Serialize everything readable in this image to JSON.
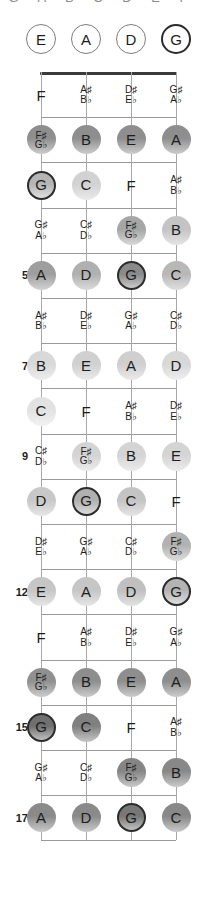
{
  "title_clipped": "G A B C D E F",
  "layout": {
    "strings": [
      "E",
      "A",
      "D",
      "G"
    ],
    "string_x": [
      41,
      86,
      131,
      176
    ],
    "nut_y": 72,
    "fret_spacing": 45.2,
    "open_circle_y": 39,
    "accent_color": "#2c2c2c",
    "nut_color": "#3a3a3a",
    "fret_color": "#9a9a9a",
    "string_color": "#a8a8a8"
  },
  "open_strings": [
    {
      "label": "E",
      "accent": false
    },
    {
      "label": "A",
      "accent": false
    },
    {
      "label": "D",
      "accent": false
    },
    {
      "label": "G",
      "accent": true
    }
  ],
  "fret_numbers": [
    {
      "fret": 5,
      "label": "5"
    },
    {
      "fret": 7,
      "label": "7"
    },
    {
      "fret": 9,
      "label": "9"
    },
    {
      "fret": 12,
      "label": "12"
    },
    {
      "fret": 15,
      "label": "15"
    },
    {
      "fret": 17,
      "label": "17"
    }
  ],
  "frets": [
    {
      "fret": 1,
      "notes": [
        {
          "string": 0,
          "name": "F",
          "shape": "plain",
          "accidental": false,
          "shade": null,
          "accent": false
        },
        {
          "string": 1,
          "name": "A♯/B♭",
          "top": "A♯",
          "bottom": "B♭",
          "shape": "plain",
          "accidental": true,
          "shade": null,
          "accent": false
        },
        {
          "string": 2,
          "name": "D♯/E♭",
          "top": "D♯",
          "bottom": "E♭",
          "shape": "plain",
          "accidental": true,
          "shade": null,
          "accent": false
        },
        {
          "string": 3,
          "name": "G♯/A♭",
          "top": "G♯",
          "bottom": "A♭",
          "shape": "plain",
          "accidental": true,
          "shade": null,
          "accent": false
        }
      ]
    },
    {
      "fret": 2,
      "notes": [
        {
          "string": 0,
          "name": "F♯/G♭",
          "top": "F♯",
          "bottom": "G♭",
          "shape": "circle",
          "accidental": true,
          "shade": "#8e8e8e",
          "accent": false
        },
        {
          "string": 1,
          "name": "B",
          "shape": "circle",
          "accidental": false,
          "shade": "#8e8e8e",
          "accent": false
        },
        {
          "string": 2,
          "name": "E",
          "shape": "circle",
          "accidental": false,
          "shade": "#8e8e8e",
          "accent": false
        },
        {
          "string": 3,
          "name": "A",
          "shape": "circle",
          "accidental": false,
          "shade": "#8e8e8e",
          "accent": false
        }
      ]
    },
    {
      "fret": 3,
      "notes": [
        {
          "string": 0,
          "name": "G",
          "shape": "circle",
          "accidental": false,
          "shade": "#b5b5b5",
          "accent": true
        },
        {
          "string": 1,
          "name": "C",
          "shape": "circle",
          "accidental": false,
          "shade": "#d2d2d2",
          "accent": false
        },
        {
          "string": 2,
          "name": "F",
          "shape": "plain",
          "accidental": false,
          "shade": null,
          "accent": false
        },
        {
          "string": 3,
          "name": "A♯/B♭",
          "top": "A♯",
          "bottom": "B♭",
          "shape": "plain",
          "accidental": true,
          "shade": null,
          "accent": false
        }
      ]
    },
    {
      "fret": 4,
      "notes": [
        {
          "string": 0,
          "name": "G♯/A♭",
          "top": "G♯",
          "bottom": "A♭",
          "shape": "plain",
          "accidental": true,
          "shade": null,
          "accent": false
        },
        {
          "string": 1,
          "name": "C♯/D♭",
          "top": "C♯",
          "bottom": "D♭",
          "shape": "plain",
          "accidental": true,
          "shade": null,
          "accent": false
        },
        {
          "string": 2,
          "name": "F♯/G♭",
          "top": "F♯",
          "bottom": "G♭",
          "shape": "circle",
          "accidental": true,
          "shade": "#a6a6a6",
          "accent": false
        },
        {
          "string": 3,
          "name": "B",
          "shape": "circle",
          "accidental": false,
          "shade": "#c4c4c4",
          "accent": false
        }
      ]
    },
    {
      "fret": 5,
      "notes": [
        {
          "string": 0,
          "name": "A",
          "shape": "circle",
          "accidental": false,
          "shade": "#9e9e9e",
          "accent": false
        },
        {
          "string": 1,
          "name": "D",
          "shape": "circle",
          "accidental": false,
          "shade": "#b0b0b0",
          "accent": false
        },
        {
          "string": 2,
          "name": "G",
          "shape": "circle",
          "accidental": false,
          "shade": "#8a8a8a",
          "accent": true
        },
        {
          "string": 3,
          "name": "C",
          "shape": "circle",
          "accidental": false,
          "shade": "#b8b8b8",
          "accent": false
        }
      ]
    },
    {
      "fret": 6,
      "notes": [
        {
          "string": 0,
          "name": "A♯/B♭",
          "top": "A♯",
          "bottom": "B♭",
          "shape": "plain",
          "accidental": true,
          "shade": null,
          "accent": false
        },
        {
          "string": 1,
          "name": "D♯/E♭",
          "top": "D♯",
          "bottom": "E♭",
          "shape": "plain",
          "accidental": true,
          "shade": null,
          "accent": false
        },
        {
          "string": 2,
          "name": "G♯/A♭",
          "top": "G♯",
          "bottom": "A♭",
          "shape": "plain",
          "accidental": true,
          "shade": null,
          "accent": false
        },
        {
          "string": 3,
          "name": "C♯/D♭",
          "top": "C♯",
          "bottom": "D♭",
          "shape": "plain",
          "accidental": true,
          "shade": null,
          "accent": false
        }
      ]
    },
    {
      "fret": 7,
      "notes": [
        {
          "string": 0,
          "name": "B",
          "shape": "circle",
          "accidental": false,
          "shade": "#d8d8d8",
          "accent": false
        },
        {
          "string": 1,
          "name": "E",
          "shape": "circle",
          "accidental": false,
          "shade": "#d0d0d0",
          "accent": false
        },
        {
          "string": 2,
          "name": "A",
          "shape": "circle",
          "accidental": false,
          "shade": "#cfcfcf",
          "accent": false
        },
        {
          "string": 3,
          "name": "D",
          "shape": "circle",
          "accidental": false,
          "shade": "#d8d8d8",
          "accent": false
        }
      ]
    },
    {
      "fret": 8,
      "notes": [
        {
          "string": 0,
          "name": "C",
          "shape": "circle",
          "accidental": false,
          "shade": "#e2e2e2",
          "accent": false
        },
        {
          "string": 1,
          "name": "F",
          "shape": "plain",
          "accidental": false,
          "shade": null,
          "accent": false
        },
        {
          "string": 2,
          "name": "A♯/B♭",
          "top": "A♯",
          "bottom": "B♭",
          "shape": "plain",
          "accidental": true,
          "shade": null,
          "accent": false
        },
        {
          "string": 3,
          "name": "D♯/E♭",
          "top": "D♯",
          "bottom": "E♭",
          "shape": "plain",
          "accidental": true,
          "shade": null,
          "accent": false
        }
      ]
    },
    {
      "fret": 9,
      "notes": [
        {
          "string": 0,
          "name": "C♯/D♭",
          "top": "C♯",
          "bottom": "D♭",
          "shape": "plain",
          "accidental": true,
          "shade": null,
          "accent": false
        },
        {
          "string": 1,
          "name": "F♯/G♭",
          "top": "F♯",
          "bottom": "G♭",
          "shape": "circle",
          "accidental": true,
          "shade": "#d4d4d4",
          "accent": false
        },
        {
          "string": 2,
          "name": "B",
          "shape": "circle",
          "accidental": false,
          "shade": "#d4d4d4",
          "accent": false
        },
        {
          "string": 3,
          "name": "E",
          "shape": "circle",
          "accidental": false,
          "shade": "#d4d4d4",
          "accent": false
        }
      ]
    },
    {
      "fret": 10,
      "notes": [
        {
          "string": 0,
          "name": "D",
          "shape": "circle",
          "accidental": false,
          "shade": "#c8c8c8",
          "accent": false
        },
        {
          "string": 1,
          "name": "G",
          "shape": "circle",
          "accidental": false,
          "shade": "#b0b0b0",
          "accent": true
        },
        {
          "string": 2,
          "name": "C",
          "shape": "circle",
          "accidental": false,
          "shade": "#c4c4c4",
          "accent": false
        },
        {
          "string": 3,
          "name": "F",
          "shape": "plain",
          "accidental": false,
          "shade": null,
          "accent": false
        }
      ]
    },
    {
      "fret": 11,
      "notes": [
        {
          "string": 0,
          "name": "D♯/E♭",
          "top": "D♯",
          "bottom": "E♭",
          "shape": "plain",
          "accidental": true,
          "shade": null,
          "accent": false
        },
        {
          "string": 1,
          "name": "G♯/A♭",
          "top": "G♯",
          "bottom": "A♭",
          "shape": "plain",
          "accidental": true,
          "shade": null,
          "accent": false
        },
        {
          "string": 2,
          "name": "C♯/D♭",
          "top": "C♯",
          "bottom": "D♭",
          "shape": "plain",
          "accidental": true,
          "shade": null,
          "accent": false
        },
        {
          "string": 3,
          "name": "F♯/G♭",
          "top": "F♯",
          "bottom": "G♭",
          "shape": "circle",
          "accidental": true,
          "shade": "#b2b2b2",
          "accent": false
        }
      ]
    },
    {
      "fret": 12,
      "notes": [
        {
          "string": 0,
          "name": "E",
          "shape": "circle",
          "accidental": false,
          "shade": "#c6c6c6",
          "accent": false
        },
        {
          "string": 1,
          "name": "A",
          "shape": "circle",
          "accidental": false,
          "shade": "#c6c6c6",
          "accent": false
        },
        {
          "string": 2,
          "name": "D",
          "shape": "circle",
          "accidental": false,
          "shade": "#c0c0c0",
          "accent": false
        },
        {
          "string": 3,
          "name": "G",
          "shape": "circle",
          "accidental": false,
          "shade": "#b4b4b4",
          "accent": true
        }
      ]
    },
    {
      "fret": 13,
      "notes": [
        {
          "string": 0,
          "name": "F",
          "shape": "plain",
          "accidental": false,
          "shade": null,
          "accent": false
        },
        {
          "string": 1,
          "name": "A♯/B♭",
          "top": "A♯",
          "bottom": "B♭",
          "shape": "plain",
          "accidental": true,
          "shade": null,
          "accent": false
        },
        {
          "string": 2,
          "name": "D♯/E♭",
          "top": "D♯",
          "bottom": "E♭",
          "shape": "plain",
          "accidental": true,
          "shade": null,
          "accent": false
        },
        {
          "string": 3,
          "name": "G♯/A♭",
          "top": "G♯",
          "bottom": "A♭",
          "shape": "plain",
          "accidental": true,
          "shade": null,
          "accent": false
        }
      ]
    },
    {
      "fret": 14,
      "notes": [
        {
          "string": 0,
          "name": "F♯/G♭",
          "top": "F♯",
          "bottom": "G♭",
          "shape": "circle",
          "accidental": true,
          "shade": "#909090",
          "accent": false
        },
        {
          "string": 1,
          "name": "B",
          "shape": "circle",
          "accidental": false,
          "shade": "#8e8e8e",
          "accent": false
        },
        {
          "string": 2,
          "name": "E",
          "shape": "circle",
          "accidental": false,
          "shade": "#8e8e8e",
          "accent": false
        },
        {
          "string": 3,
          "name": "A",
          "shape": "circle",
          "accidental": false,
          "shade": "#8e8e8e",
          "accent": false
        }
      ]
    },
    {
      "fret": 15,
      "notes": [
        {
          "string": 0,
          "name": "G",
          "shape": "circle",
          "accidental": false,
          "shade": "#707070",
          "accent": true
        },
        {
          "string": 1,
          "name": "C",
          "shape": "circle",
          "accidental": false,
          "shade": "#808080",
          "accent": false
        },
        {
          "string": 2,
          "name": "F",
          "shape": "plain",
          "accidental": false,
          "shade": null,
          "accent": false
        },
        {
          "string": 3,
          "name": "A♯/B♭",
          "top": "A♯",
          "bottom": "B♭",
          "shape": "plain",
          "accidental": true,
          "shade": null,
          "accent": false
        }
      ]
    },
    {
      "fret": 16,
      "notes": [
        {
          "string": 0,
          "name": "G♯/A♭",
          "top": "G♯",
          "bottom": "A♭",
          "shape": "plain",
          "accidental": true,
          "shade": null,
          "accent": false
        },
        {
          "string": 1,
          "name": "C♯/D♭",
          "top": "C♯",
          "bottom": "D♭",
          "shape": "plain",
          "accidental": true,
          "shade": null,
          "accent": false
        },
        {
          "string": 2,
          "name": "F♯/G♭",
          "top": "F♯",
          "bottom": "G♭",
          "shape": "circle",
          "accidental": true,
          "shade": "#858585",
          "accent": false
        },
        {
          "string": 3,
          "name": "B",
          "shape": "circle",
          "accidental": false,
          "shade": "#888888",
          "accent": false
        }
      ]
    },
    {
      "fret": 17,
      "notes": [
        {
          "string": 0,
          "name": "A",
          "shape": "circle",
          "accidental": false,
          "shade": "#8a8a8a",
          "accent": false
        },
        {
          "string": 1,
          "name": "D",
          "shape": "circle",
          "accidental": false,
          "shade": "#8a8a8a",
          "accent": false
        },
        {
          "string": 2,
          "name": "G",
          "shape": "circle",
          "accidental": false,
          "shade": "#777777",
          "accent": true
        },
        {
          "string": 3,
          "name": "C",
          "shape": "circle",
          "accidental": false,
          "shade": "#888888",
          "accent": false
        }
      ]
    }
  ]
}
